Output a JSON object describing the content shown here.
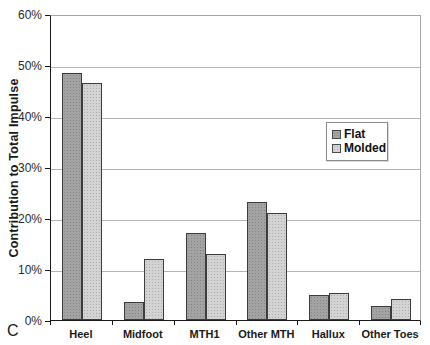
{
  "panel_label": "C",
  "chart_data": {
    "type": "bar",
    "title": "",
    "xlabel": "",
    "ylabel": "Contribution to Total Impulse",
    "ylim": [
      0,
      60
    ],
    "ytick_labels": [
      "0%",
      "10%",
      "20%",
      "30%",
      "40%",
      "50%",
      "60%"
    ],
    "grid": true,
    "legend_position": "middle-right-inside",
    "categories": [
      "Heel",
      "Midfoot",
      "MTH1",
      "Other MTH",
      "Hallux",
      "Other Toes"
    ],
    "series": [
      {
        "name": "Flat",
        "values": [
          48.4,
          3.6,
          17.0,
          23.1,
          5.0,
          2.8
        ]
      },
      {
        "name": "Molded",
        "values": [
          46.4,
          11.9,
          12.9,
          21.0,
          5.3,
          4.1
        ]
      }
    ],
    "colors": {
      "flat_fill": "#a3a3a3",
      "molded_fill": "#d3d3d3",
      "bar_border": "#3c3c3c",
      "gridline": "#b4b4b4",
      "axis": "#1a1a1a"
    }
  }
}
